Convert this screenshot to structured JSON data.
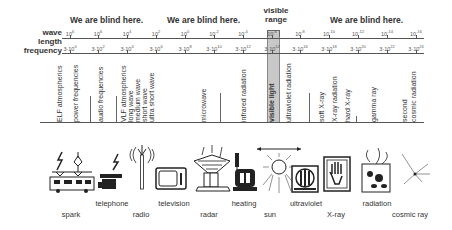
{
  "header": {
    "blind_labels": [
      "We are blind here.",
      "We are blind here.",
      "We are blind here."
    ],
    "visible_range_label": "visible range"
  },
  "axes": {
    "wavelength_label": "wave length",
    "frequency_label": "frequency",
    "wavelength_ticks": [
      {
        "base": "10",
        "exp": "6"
      },
      {
        "base": "10",
        "exp": "6"
      },
      {
        "base": "10",
        "exp": "4"
      },
      {
        "base": "10",
        "exp": "2"
      },
      {
        "base": "10",
        "exp": "0"
      },
      {
        "base": "10",
        "exp": "-2"
      },
      {
        "base": "10",
        "exp": "-4"
      },
      {
        "base": "10",
        "exp": "-6"
      },
      {
        "base": "10",
        "exp": "-8"
      },
      {
        "base": "10",
        "exp": "-10"
      },
      {
        "base": "10",
        "exp": "-12"
      },
      {
        "base": "10",
        "exp": "-14"
      },
      {
        "base": "10",
        "exp": "-16"
      }
    ],
    "frequency_ticks": [
      {
        "base": "3·10",
        "exp": "0"
      },
      {
        "base": "3·10",
        "exp": "2"
      },
      {
        "base": "3·10",
        "exp": "4"
      },
      {
        "base": "3·10",
        "exp": "6"
      },
      {
        "base": "3·10",
        "exp": "8"
      },
      {
        "base": "3·10",
        "exp": "10"
      },
      {
        "base": "3·10",
        "exp": "12"
      },
      {
        "base": "3·10",
        "exp": "14"
      },
      {
        "base": "3·10",
        "exp": "16"
      },
      {
        "base": "3·10",
        "exp": "18"
      },
      {
        "base": "3·10",
        "exp": "20"
      },
      {
        "base": "3·10",
        "exp": "22"
      },
      {
        "base": "3·10",
        "exp": "24"
      }
    ]
  },
  "bands": [
    "ELF atmospherics",
    "power frequencies",
    "audio frequencies",
    "VLF atmospherics",
    "long wave",
    "medium wave",
    "short wave",
    "ultra short wave",
    "microwave",
    "infrared radiation",
    "visible light",
    "ultraviolet radiation",
    "soft X-ray",
    "X-ray radiation",
    "hard X-ray",
    "gamma ray",
    "second",
    "cosmic radiation"
  ],
  "sources": [
    {
      "label": "spark",
      "icon": "spark-train-icon"
    },
    {
      "label": "telephone",
      "icon": "telephone-icon"
    },
    {
      "label": "radio",
      "icon": "radio-tower-icon"
    },
    {
      "label": "television",
      "icon": "television-icon"
    },
    {
      "label": "radar",
      "icon": "radar-icon"
    },
    {
      "label": "heating",
      "icon": "heater-icon"
    },
    {
      "label": "sun",
      "icon": "sun-icon"
    },
    {
      "label": "ultraviolet",
      "icon": "uv-lamp-icon"
    },
    {
      "label": "X-ray",
      "icon": "xray-hand-icon"
    },
    {
      "label": "radiation",
      "icon": "radiation-source-icon"
    },
    {
      "label": "cosmic ray",
      "icon": "cosmic-ray-icon"
    }
  ],
  "colors": {
    "visible_band": "#c8c8c8",
    "line": "#555555",
    "text": "#333333"
  }
}
